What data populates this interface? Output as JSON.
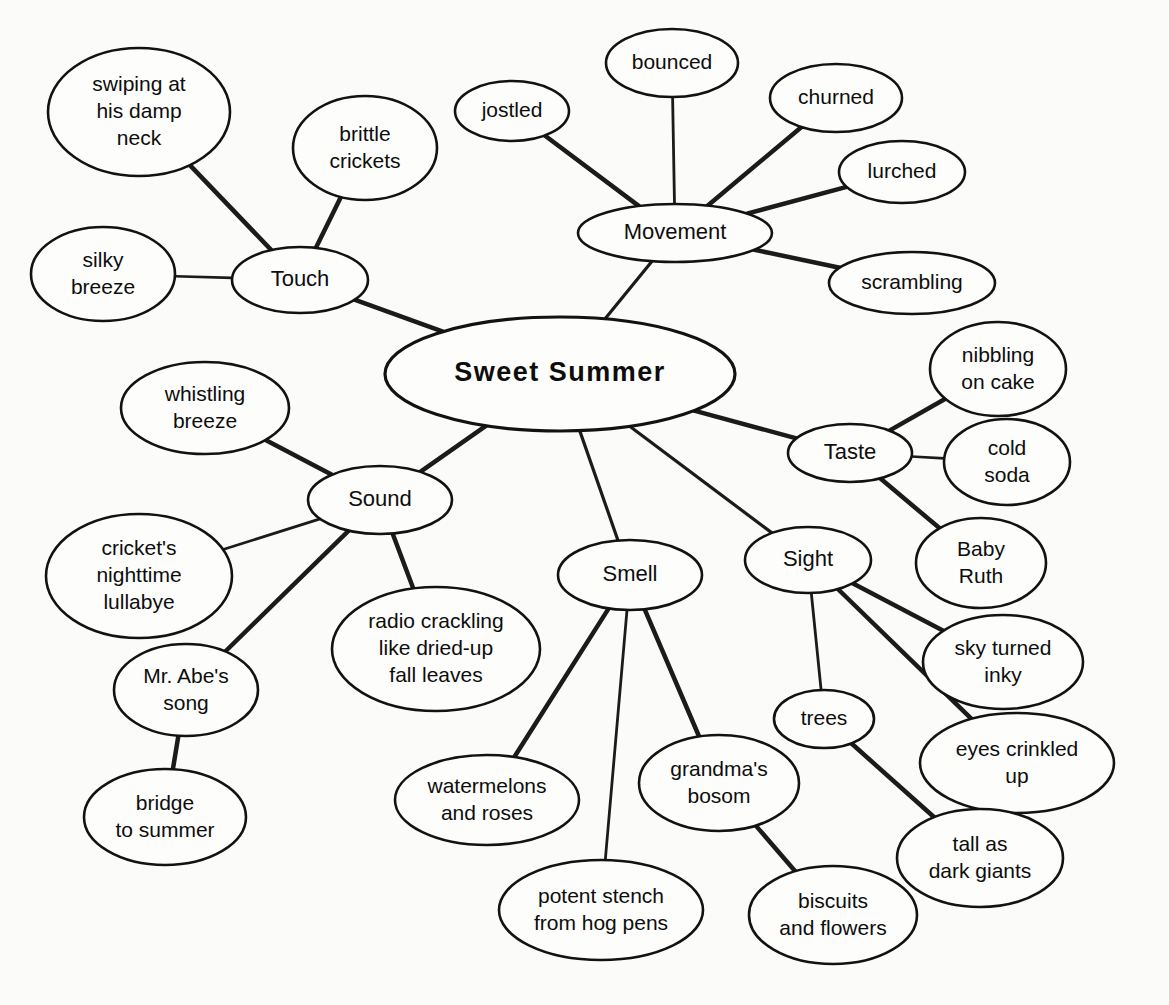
{
  "diagram": {
    "type": "mind-map",
    "title": "Sweet Summer",
    "background": "#fbfbf9",
    "ink": "#121212",
    "root": {
      "id": "root",
      "label": "Sweet Summer",
      "cx": 560,
      "cy": 374,
      "rx": 175,
      "ry": 57,
      "level": 0
    },
    "nodes": [
      {
        "id": "touch",
        "label": "Touch",
        "cx": 300,
        "cy": 280,
        "rx": 68,
        "ry": 33,
        "level": 1
      },
      {
        "id": "swiping",
        "label": "swiping at\nhis damp\nneck",
        "cx": 139,
        "cy": 112,
        "rx": 91,
        "ry": 64,
        "level": 2
      },
      {
        "id": "brittle",
        "label": "brittle\ncrickets",
        "cx": 365,
        "cy": 148,
        "rx": 72,
        "ry": 52,
        "level": 2
      },
      {
        "id": "silky",
        "label": "silky\nbreeze",
        "cx": 103,
        "cy": 274,
        "rx": 72,
        "ry": 47,
        "level": 2
      },
      {
        "id": "movement",
        "label": "Movement",
        "cx": 675,
        "cy": 233,
        "rx": 97,
        "ry": 29,
        "level": 1
      },
      {
        "id": "jostled",
        "label": "jostled",
        "cx": 512,
        "cy": 111,
        "rx": 57,
        "ry": 30,
        "level": 2
      },
      {
        "id": "bounced",
        "label": "bounced",
        "cx": 672,
        "cy": 63,
        "rx": 66,
        "ry": 34,
        "level": 2
      },
      {
        "id": "churned",
        "label": "churned",
        "cx": 836,
        "cy": 98,
        "rx": 66,
        "ry": 34,
        "level": 2
      },
      {
        "id": "lurched",
        "label": "lurched",
        "cx": 902,
        "cy": 172,
        "rx": 63,
        "ry": 31,
        "level": 2
      },
      {
        "id": "scrambling",
        "label": "scrambling",
        "cx": 912,
        "cy": 283,
        "rx": 83,
        "ry": 31,
        "level": 2
      },
      {
        "id": "taste",
        "label": "Taste",
        "cx": 850,
        "cy": 453,
        "rx": 62,
        "ry": 29,
        "level": 1
      },
      {
        "id": "nibbling",
        "label": "nibbling\non cake",
        "cx": 998,
        "cy": 369,
        "rx": 68,
        "ry": 47,
        "level": 2
      },
      {
        "id": "coldsoda",
        "label": "cold\nsoda",
        "cx": 1007,
        "cy": 462,
        "rx": 63,
        "ry": 43,
        "level": 2
      },
      {
        "id": "babyruth",
        "label": "Baby\nRuth",
        "cx": 981,
        "cy": 563,
        "rx": 65,
        "ry": 45,
        "level": 2
      },
      {
        "id": "sight",
        "label": "Sight",
        "cx": 808,
        "cy": 560,
        "rx": 63,
        "ry": 33,
        "level": 1
      },
      {
        "id": "skyturned",
        "label": "sky turned\ninky",
        "cx": 1003,
        "cy": 662,
        "rx": 80,
        "ry": 47,
        "level": 2
      },
      {
        "id": "eyescrinkled",
        "label": "eyes crinkled\nup",
        "cx": 1017,
        "cy": 763,
        "rx": 97,
        "ry": 50,
        "level": 2
      },
      {
        "id": "trees",
        "label": "trees",
        "cx": 824,
        "cy": 719,
        "rx": 50,
        "ry": 29,
        "level": 2
      },
      {
        "id": "tallgiants",
        "label": "tall as\ndark giants",
        "cx": 980,
        "cy": 858,
        "rx": 83,
        "ry": 49,
        "level": 3
      },
      {
        "id": "smell",
        "label": "Smell",
        "cx": 630,
        "cy": 575,
        "rx": 72,
        "ry": 35,
        "level": 1
      },
      {
        "id": "watermelons",
        "label": "watermelons\nand roses",
        "cx": 487,
        "cy": 800,
        "rx": 92,
        "ry": 45,
        "level": 2
      },
      {
        "id": "potentstench",
        "label": "potent stench\nfrom hog pens",
        "cx": 601,
        "cy": 910,
        "rx": 102,
        "ry": 50,
        "level": 2
      },
      {
        "id": "grandmas",
        "label": "grandma's\nbosom",
        "cx": 719,
        "cy": 783,
        "rx": 80,
        "ry": 48,
        "level": 2
      },
      {
        "id": "biscuits",
        "label": "biscuits\nand flowers",
        "cx": 833,
        "cy": 915,
        "rx": 84,
        "ry": 49,
        "level": 3
      },
      {
        "id": "sound",
        "label": "Sound",
        "cx": 380,
        "cy": 500,
        "rx": 72,
        "ry": 34,
        "level": 1
      },
      {
        "id": "whistling",
        "label": "whistling\nbreeze",
        "cx": 205,
        "cy": 408,
        "rx": 84,
        "ry": 46,
        "level": 2
      },
      {
        "id": "crickets",
        "label": "cricket's\nnighttime\nlullabye",
        "cx": 139,
        "cy": 576,
        "rx": 93,
        "ry": 62,
        "level": 2
      },
      {
        "id": "radio",
        "label": "radio crackling\nlike dried-up\nfall leaves",
        "cx": 436,
        "cy": 649,
        "rx": 104,
        "ry": 62,
        "level": 2
      },
      {
        "id": "mrabe",
        "label": "Mr. Abe's\nsong",
        "cx": 186,
        "cy": 690,
        "rx": 72,
        "ry": 46,
        "level": 2
      },
      {
        "id": "bridge",
        "label": "bridge\nto summer",
        "cx": 165,
        "cy": 817,
        "rx": 81,
        "ry": 48,
        "level": 3
      }
    ],
    "edges": [
      {
        "from": "root",
        "to": "touch",
        "width": 4.5
      },
      {
        "from": "root",
        "to": "movement",
        "width": 3.2
      },
      {
        "from": "root",
        "to": "taste",
        "width": 4.5
      },
      {
        "from": "root",
        "to": "sight",
        "width": 3.2
      },
      {
        "from": "root",
        "to": "smell",
        "width": 3.2
      },
      {
        "from": "root",
        "to": "sound",
        "width": 4.5
      },
      {
        "from": "touch",
        "to": "swiping",
        "width": 4.5
      },
      {
        "from": "touch",
        "to": "brittle",
        "width": 4.5
      },
      {
        "from": "touch",
        "to": "silky",
        "width": 2.6
      },
      {
        "from": "movement",
        "to": "jostled",
        "width": 4.5
      },
      {
        "from": "movement",
        "to": "bounced",
        "width": 2.8
      },
      {
        "from": "movement",
        "to": "churned",
        "width": 4.5
      },
      {
        "from": "movement",
        "to": "lurched",
        "width": 4.5
      },
      {
        "from": "movement",
        "to": "scrambling",
        "width": 4.5
      },
      {
        "from": "taste",
        "to": "nibbling",
        "width": 4.5
      },
      {
        "from": "taste",
        "to": "coldsoda",
        "width": 2.6
      },
      {
        "from": "taste",
        "to": "babyruth",
        "width": 4.5
      },
      {
        "from": "sight",
        "to": "skyturned",
        "width": 4.5
      },
      {
        "from": "sight",
        "to": "eyescrinkled",
        "width": 4.5
      },
      {
        "from": "sight",
        "to": "trees",
        "width": 2.8
      },
      {
        "from": "trees",
        "to": "tallgiants",
        "width": 4.5
      },
      {
        "from": "smell",
        "to": "watermelons",
        "width": 4.5
      },
      {
        "from": "smell",
        "to": "potentstench",
        "width": 2.8
      },
      {
        "from": "smell",
        "to": "grandmas",
        "width": 4.5
      },
      {
        "from": "grandmas",
        "to": "biscuits",
        "width": 4.5
      },
      {
        "from": "sound",
        "to": "whistling",
        "width": 4.5
      },
      {
        "from": "sound",
        "to": "crickets",
        "width": 2.8
      },
      {
        "from": "sound",
        "to": "radio",
        "width": 4.5
      },
      {
        "from": "sound",
        "to": "mrabe",
        "width": 4.5
      },
      {
        "from": "mrabe",
        "to": "bridge",
        "width": 4.5
      }
    ]
  }
}
